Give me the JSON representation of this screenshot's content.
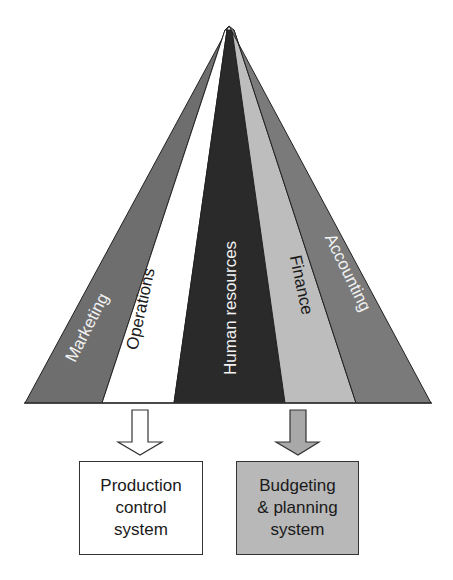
{
  "diagram": {
    "type": "fan-pyramid",
    "segments": [
      {
        "label": "Marketing",
        "fill": "#6e6e6e",
        "text_color": "#f2f2f2"
      },
      {
        "label": "Operations",
        "fill": "#ffffff",
        "text_color": "#1a1a1a"
      },
      {
        "label": "Human resources",
        "fill": "#2a2a2a",
        "text_color": "#f2f2f2"
      },
      {
        "label": "Finance",
        "fill": "#bdbdbd",
        "text_color": "#1a1a1a"
      },
      {
        "label": "Accounting",
        "fill": "#7a7a7a",
        "text_color": "#f2f2f2"
      }
    ],
    "outputs": [
      {
        "from": "Operations",
        "lines": [
          "Production",
          "control",
          "system"
        ],
        "fill": "#ffffff",
        "arrow_fill": "#ffffff"
      },
      {
        "from": "Finance",
        "lines": [
          "Budgeting",
          "& planning",
          "system"
        ],
        "fill": "#b8b8b8",
        "arrow_fill": "#a8a8a8"
      }
    ]
  }
}
